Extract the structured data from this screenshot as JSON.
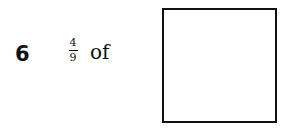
{
  "question": {
    "number": "6",
    "fraction": {
      "numerator": "4",
      "denominator": "9"
    },
    "text": "of",
    "answer_box": {
      "value": ""
    }
  }
}
